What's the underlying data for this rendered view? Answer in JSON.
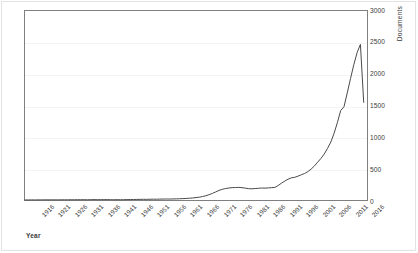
{
  "chart_data": {
    "type": "line",
    "title": "",
    "xlabel": "Year",
    "ylabel": "Documents",
    "xlim": [
      1914,
      2018
    ],
    "ylim": [
      0,
      3000
    ],
    "grid": true,
    "legend": false,
    "line_color": "#4a4a4a",
    "axis_color": "#7f7f7f",
    "grid_color": "#f4f4f4",
    "text_color": "#3b3b3b",
    "y_ticks": [
      "0",
      "500",
      "1000",
      "1500",
      "2000",
      "2500",
      "3000"
    ],
    "y_tick_values": [
      0,
      500,
      1000,
      1500,
      2000,
      2500,
      3000
    ],
    "x_ticks": [
      "1916",
      "1921",
      "1926",
      "1931",
      "1936",
      "1941",
      "1946",
      "1951",
      "1956",
      "1961",
      "1966",
      "1971",
      "1976",
      "1981",
      "1986",
      "1991",
      "1996",
      "2001",
      "2006",
      "2011",
      "2016"
    ],
    "x_tick_values": [
      1916,
      1921,
      1926,
      1931,
      1936,
      1941,
      1946,
      1951,
      1956,
      1961,
      1966,
      1971,
      1976,
      1981,
      1986,
      1991,
      1996,
      2001,
      2006,
      2011,
      2016
    ],
    "x": [
      1914,
      1915,
      1916,
      1917,
      1918,
      1919,
      1920,
      1921,
      1922,
      1923,
      1924,
      1925,
      1926,
      1927,
      1928,
      1929,
      1930,
      1931,
      1932,
      1933,
      1934,
      1935,
      1936,
      1937,
      1938,
      1939,
      1940,
      1941,
      1942,
      1943,
      1944,
      1945,
      1946,
      1947,
      1948,
      1949,
      1950,
      1951,
      1952,
      1953,
      1954,
      1955,
      1956,
      1957,
      1958,
      1959,
      1960,
      1961,
      1962,
      1963,
      1964,
      1965,
      1966,
      1967,
      1968,
      1969,
      1970,
      1971,
      1972,
      1973,
      1974,
      1975,
      1976,
      1977,
      1978,
      1979,
      1980,
      1981,
      1982,
      1983,
      1984,
      1985,
      1986,
      1987,
      1988,
      1989,
      1990,
      1991,
      1992,
      1993,
      1994,
      1995,
      1996,
      1997,
      1998,
      1999,
      2000,
      2001,
      2002,
      2003,
      2004,
      2005,
      2006,
      2007,
      2008,
      2009,
      2010,
      2011,
      2012,
      2013,
      2014,
      2015,
      2016,
      2017
    ],
    "y": [
      1,
      1,
      2,
      1,
      2,
      2,
      3,
      2,
      3,
      3,
      2,
      3,
      4,
      3,
      4,
      4,
      5,
      4,
      5,
      4,
      5,
      6,
      5,
      6,
      5,
      6,
      5,
      4,
      5,
      4,
      5,
      6,
      7,
      8,
      9,
      10,
      11,
      10,
      12,
      13,
      12,
      14,
      15,
      16,
      15,
      17,
      18,
      20,
      22,
      25,
      28,
      32,
      38,
      45,
      55,
      68,
      85,
      105,
      128,
      152,
      170,
      182,
      190,
      196,
      198,
      200,
      196,
      188,
      180,
      178,
      182,
      186,
      190,
      188,
      192,
      196,
      200,
      230,
      268,
      300,
      330,
      352,
      360,
      378,
      400,
      420,
      450,
      490,
      540,
      600,
      660,
      730,
      820,
      920,
      1060,
      1230,
      1420,
      1480,
      1700,
      1930,
      2150,
      2340,
      2470,
      1550
    ],
    "series": [
      {
        "name": "Documents",
        "values": [
          1,
          1,
          2,
          1,
          2,
          2,
          3,
          2,
          3,
          3,
          2,
          3,
          4,
          3,
          4,
          4,
          5,
          4,
          5,
          4,
          5,
          6,
          5,
          6,
          5,
          6,
          5,
          4,
          5,
          4,
          5,
          6,
          7,
          8,
          9,
          10,
          11,
          10,
          12,
          13,
          12,
          14,
          15,
          16,
          15,
          17,
          18,
          20,
          22,
          25,
          28,
          32,
          38,
          45,
          55,
          68,
          85,
          105,
          128,
          152,
          170,
          182,
          190,
          196,
          198,
          200,
          196,
          188,
          180,
          178,
          182,
          186,
          190,
          188,
          192,
          196,
          200,
          230,
          268,
          300,
          330,
          352,
          360,
          378,
          400,
          420,
          450,
          490,
          540,
          600,
          660,
          730,
          820,
          920,
          1060,
          1230,
          1420,
          1480,
          1700,
          1930,
          2150,
          2340,
          2470,
          1550
        ]
      }
    ],
    "annotations": {
      "peak_year": 2016,
      "peak_value": 2470,
      "final_year": 2017,
      "final_value": 1550
    }
  }
}
